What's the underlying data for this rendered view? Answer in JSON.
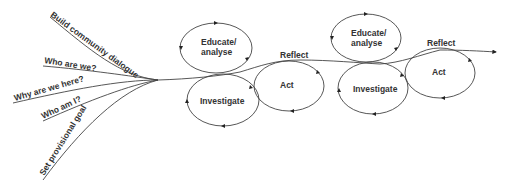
{
  "diagram": {
    "branches": [
      {
        "label": "Build community dialogue"
      },
      {
        "label": "Who are we?"
      },
      {
        "label": "Why are we here?"
      },
      {
        "label": "Who am I?"
      },
      {
        "label": "Set provisional goal"
      }
    ],
    "cycles": [
      {
        "educate": "Educate/",
        "educate2": "analyse",
        "investigate": "Investigate",
        "act": "Act",
        "reflect": "Reflect"
      },
      {
        "educate": "Educate/",
        "educate2": "analyse",
        "investigate": "Investigate",
        "act": "Act",
        "reflect": "Reflect"
      }
    ],
    "colors": {
      "line": "#444444",
      "text": "#333333"
    }
  }
}
